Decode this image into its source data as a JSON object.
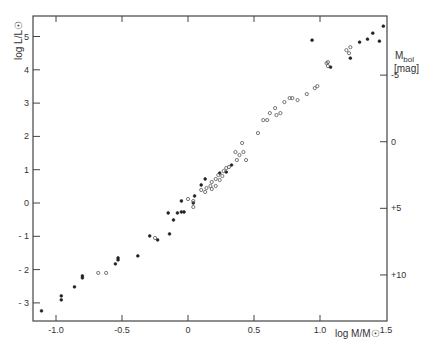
{
  "chart_data": {
    "type": "scatter",
    "title": "",
    "xlabel": "log M/M☉",
    "ylabel": "log L/L☉",
    "y2label": "M_bol [mag]",
    "y2label_main": "M",
    "y2label_sub": "bol",
    "y2label_unit": "[mag]",
    "xlim": [
      -1.2,
      1.5
    ],
    "ylim": [
      -3.55,
      5.5
    ],
    "x_ticks": [
      -1.0,
      -0.5,
      0,
      0.5,
      1.0,
      1.5
    ],
    "x_tick_labels": [
      "-1.0",
      "-0.5",
      "0",
      "0.5",
      "1.0",
      "1.5"
    ],
    "y_ticks": [
      -3,
      -2,
      -1,
      0,
      1,
      2,
      3,
      4,
      5
    ],
    "y_tick_labels": [
      "- 3",
      "- 2",
      "- 1",
      "0",
      "1",
      "2",
      "3",
      "4",
      "5"
    ],
    "y2_ticks_mag": [
      -5,
      0,
      5,
      10
    ],
    "y2_tick_labels": [
      "-5",
      "0",
      "+5",
      "+10"
    ],
    "y2_zero_point_logL": 1.84,
    "y2_scale_mag_per_logL": -2.5,
    "grid": false,
    "legend": "none",
    "series": [
      {
        "name": "filled",
        "marker": "filled-circle",
        "points": [
          [
            -1.11,
            -3.24
          ],
          [
            -0.96,
            -2.79
          ],
          [
            -0.96,
            -2.91
          ],
          [
            -0.86,
            -2.52
          ],
          [
            -0.8,
            -2.19
          ],
          [
            -0.8,
            -2.25
          ],
          [
            -0.55,
            -1.83
          ],
          [
            -0.53,
            -1.65
          ],
          [
            -0.53,
            -1.71
          ],
          [
            -0.38,
            -1.59
          ],
          [
            -0.29,
            -0.99
          ],
          [
            -0.23,
            -1.11
          ],
          [
            -0.14,
            -0.93
          ],
          [
            -0.11,
            -0.51
          ],
          [
            -0.15,
            -0.3
          ],
          [
            -0.08,
            -0.3
          ],
          [
            -0.05,
            -0.27
          ],
          [
            -0.03,
            -0.27
          ],
          [
            -0.05,
            0.06
          ],
          [
            0.05,
            0.21
          ],
          [
            0.04,
            0.0
          ],
          [
            0.1,
            0.54
          ],
          [
            0.13,
            0.72
          ],
          [
            0.24,
            0.9
          ],
          [
            0.33,
            1.14
          ],
          [
            0.29,
            0.93
          ],
          [
            0.94,
            4.89
          ],
          [
            1.08,
            4.08
          ],
          [
            1.23,
            4.35
          ],
          [
            1.36,
            4.92
          ],
          [
            1.4,
            5.1
          ],
          [
            1.3,
            4.83
          ],
          [
            1.45,
            4.86
          ],
          [
            1.48,
            5.31
          ]
        ]
      },
      {
        "name": "open",
        "marker": "open-circle",
        "points": [
          [
            -0.68,
            -2.1
          ],
          [
            -0.62,
            -2.1
          ],
          [
            -0.25,
            -1.05
          ],
          [
            0.0,
            0.12
          ],
          [
            0.04,
            0.06
          ],
          [
            0.04,
            -0.12
          ],
          [
            0.1,
            0.39
          ],
          [
            0.13,
            0.33
          ],
          [
            0.14,
            0.45
          ],
          [
            0.17,
            0.51
          ],
          [
            0.18,
            0.63
          ],
          [
            0.21,
            0.72
          ],
          [
            0.23,
            0.84
          ],
          [
            0.26,
            0.81
          ],
          [
            0.27,
            0.96
          ],
          [
            0.29,
            1.05
          ],
          [
            0.31,
            1.08
          ],
          [
            0.24,
            0.69
          ],
          [
            0.18,
            0.42
          ],
          [
            0.21,
            0.51
          ],
          [
            0.37,
            1.29
          ],
          [
            0.39,
            1.44
          ],
          [
            0.42,
            1.53
          ],
          [
            0.41,
            1.8
          ],
          [
            0.44,
            1.29
          ],
          [
            0.36,
            1.53
          ],
          [
            0.53,
            2.1
          ],
          [
            0.57,
            2.49
          ],
          [
            0.6,
            2.49
          ],
          [
            0.62,
            2.7
          ],
          [
            0.66,
            2.85
          ],
          [
            0.67,
            2.64
          ],
          [
            0.7,
            2.7
          ],
          [
            0.73,
            3.03
          ],
          [
            0.77,
            3.15
          ],
          [
            0.79,
            3.15
          ],
          [
            0.83,
            3.09
          ],
          [
            0.9,
            3.27
          ],
          [
            0.96,
            3.45
          ],
          [
            0.98,
            3.51
          ],
          [
            1.05,
            4.2
          ],
          [
            1.06,
            4.23
          ],
          [
            1.06,
            4.11
          ],
          [
            1.23,
            4.68
          ],
          [
            1.2,
            4.59
          ],
          [
            1.22,
            4.5
          ]
        ]
      }
    ]
  }
}
